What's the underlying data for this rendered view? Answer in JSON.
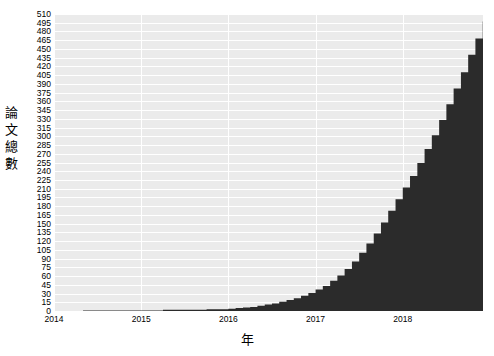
{
  "chart_data": {
    "type": "area",
    "title": "",
    "subtitle": "",
    "xlabel": "年",
    "ylabel": "論文總數",
    "grid": true,
    "legend": false,
    "legend_position": "none",
    "step": "post",
    "fill_color": "#2b2b2b",
    "plot_background": "#ebebeb",
    "gridline_color": "#ffffff",
    "xlim": [
      2014.0,
      2018.92
    ],
    "ylim": [
      0,
      510
    ],
    "xticks": [
      "2014",
      "2015",
      "2016",
      "2017",
      "2018"
    ],
    "xtick_values": [
      2014,
      2015,
      2016,
      2017,
      2018
    ],
    "yticks": [
      "0",
      "15",
      "30",
      "45",
      "60",
      "75",
      "90",
      "105",
      "120",
      "135",
      "150",
      "165",
      "180",
      "195",
      "210",
      "225",
      "240",
      "255",
      "270",
      "285",
      "300",
      "315",
      "330",
      "345",
      "360",
      "375",
      "390",
      "405",
      "420",
      "435",
      "450",
      "465",
      "480",
      "495",
      "510"
    ],
    "ytick_values": [
      0,
      15,
      30,
      45,
      60,
      75,
      90,
      105,
      120,
      135,
      150,
      165,
      180,
      195,
      210,
      225,
      240,
      255,
      270,
      285,
      300,
      315,
      330,
      345,
      360,
      375,
      390,
      405,
      420,
      435,
      450,
      465,
      480,
      495,
      510
    ],
    "series": [
      {
        "name": "論文總數",
        "x": [
          2014.0,
          2014.083,
          2014.167,
          2014.25,
          2014.333,
          2014.417,
          2014.5,
          2014.583,
          2014.667,
          2014.75,
          2014.833,
          2014.917,
          2015.0,
          2015.083,
          2015.167,
          2015.25,
          2015.333,
          2015.417,
          2015.5,
          2015.583,
          2015.667,
          2015.75,
          2015.833,
          2015.917,
          2016.0,
          2016.083,
          2016.167,
          2016.25,
          2016.333,
          2016.417,
          2016.5,
          2016.583,
          2016.667,
          2016.75,
          2016.833,
          2016.917,
          2017.0,
          2017.083,
          2017.167,
          2017.25,
          2017.333,
          2017.417,
          2017.5,
          2017.583,
          2017.667,
          2017.75,
          2017.833,
          2017.917,
          2018.0,
          2018.083,
          2018.167,
          2018.25,
          2018.333,
          2018.417,
          2018.5,
          2018.583,
          2018.667,
          2018.75,
          2018.833,
          2018.917
        ],
        "values": [
          0,
          0,
          0,
          0,
          1,
          1,
          1,
          1,
          1,
          1,
          1,
          1,
          1,
          1,
          1,
          2,
          2,
          2,
          2,
          2,
          2,
          3,
          3,
          3,
          4,
          5,
          6,
          7,
          9,
          11,
          13,
          16,
          19,
          22,
          26,
          31,
          37,
          43,
          52,
          61,
          72,
          85,
          100,
          116,
          133,
          152,
          172,
          192,
          212,
          232,
          254,
          278,
          302,
          328,
          355,
          382,
          410,
          440,
          468,
          497
        ]
      }
    ],
    "final_value": 497,
    "max_value": 497
  },
  "axes": {
    "ylabel_chars": [
      "論",
      "文",
      "總",
      "數"
    ]
  }
}
